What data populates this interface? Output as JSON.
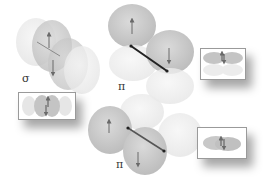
{
  "diagram": {
    "panels": [
      {
        "id": "sigma",
        "label": "σ",
        "description": "p orbitals overlapping end-on, spins up and down",
        "spins": [
          "up",
          "down"
        ]
      },
      {
        "id": "pi_top",
        "label": "π",
        "description": "side-by-side p orbitals, spins up and down",
        "spins": [
          "up",
          "down"
        ]
      },
      {
        "id": "pi_bottom",
        "label": "π",
        "description": "side-by-side p orbitals, spins up and down",
        "spins": [
          "up",
          "down"
        ]
      }
    ],
    "insets": [
      {
        "id": "inset-sigma",
        "description": "sigma bond side view with paired spins"
      },
      {
        "id": "inset-pi-top",
        "description": "pi bond lobes with paired spins"
      },
      {
        "id": "inset-pi-bottom",
        "description": "pi bond lobe overlap with paired spins"
      }
    ],
    "colors": {
      "lobe_dark": "#c8c8c8",
      "lobe_light": "#ececec",
      "arrow": "#6a6a6a",
      "bond": "#222222"
    }
  }
}
